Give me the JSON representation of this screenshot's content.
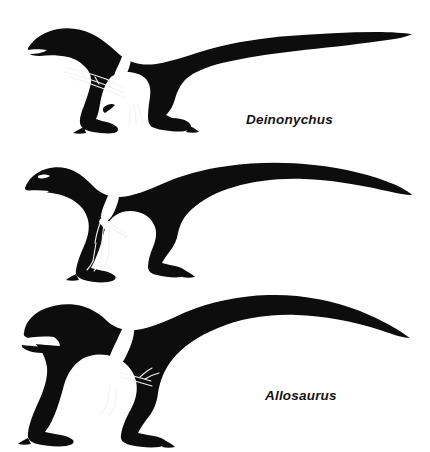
{
  "plate": {
    "background_color": "#ffffff",
    "ink_color": "#0d0d0d",
    "bone_color": "#ffffff",
    "orientation": "left-facing profile",
    "figure_count": 3,
    "caption_style": "bold italic"
  },
  "figures": [
    {
      "id": "deinonychus",
      "label": "Deinonychus",
      "group": "Dromaeosauridae",
      "pose": "striding, tail held straight and horizontal",
      "overlay": "white forelimb skeleton with three elongate clawed fingers",
      "features": "slender snout, long stiffened tail, raised sickle claw on each foot",
      "label_position": "lower right of silhouette"
    },
    {
      "id": "allosaurus",
      "label": "Allosaurus",
      "group": "Allosauroidea",
      "pose": "striding, tail curved downward at tip",
      "overlay": "white forelimb skeleton with three clawed fingers",
      "features": "boxy skull with brow crests, deep body, three-fingered hand",
      "label_position": "lower right of silhouette"
    },
    {
      "id": "tyrannosaurus",
      "label": "Tyrannosaurus",
      "group": "Tyrannosauridae",
      "pose": "striding, tail held high and tapering",
      "overlay": "white forelimb skeleton with two short clawed fingers",
      "features": "massive deep skull with exposed white teeth, very short two-fingered arm, thick neck",
      "label_position": "lower right of silhouette"
    }
  ]
}
